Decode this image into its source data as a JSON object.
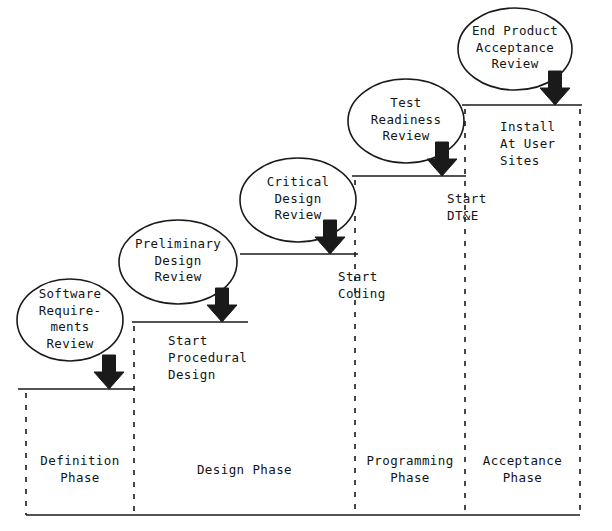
{
  "diagram": {
    "colors": {
      "line": "#1a1a1a",
      "arrow_fill": "#1a1a1a",
      "ellipse_stroke": "#1a1a1a",
      "background": "#ffffff",
      "text": "#141414"
    },
    "reviews": [
      {
        "id": "software-requirements-review",
        "lines": [
          "Software",
          "Require-",
          "ments",
          "Review"
        ],
        "cx": 70,
        "cy": 320,
        "rx": 53,
        "ry": 41
      },
      {
        "id": "preliminary-design-review",
        "lines": [
          "Preliminary",
          "Design",
          "Review"
        ],
        "cx": 178,
        "cy": 262,
        "rx": 59,
        "ry": 42
      },
      {
        "id": "critical-design-review",
        "lines": [
          "Critical",
          "Design",
          "Review"
        ],
        "cx": 298,
        "cy": 200,
        "rx": 58,
        "ry": 42
      },
      {
        "id": "test-readiness-review",
        "lines": [
          "Test",
          "Readiness",
          "Review"
        ],
        "cx": 406,
        "cy": 121,
        "rx": 58,
        "ry": 42
      },
      {
        "id": "end-product-acceptance-review",
        "lines": [
          "End Product",
          "Acceptance",
          "Review"
        ],
        "cx": 515,
        "cy": 49,
        "rx": 57,
        "ry": 41
      }
    ],
    "milestones": [
      {
        "id": "start-procedural-design",
        "lines": [
          "Start",
          "Procedural",
          "Design"
        ],
        "x": 168,
        "y": 332,
        "align": "left"
      },
      {
        "id": "start-coding",
        "lines": [
          "Start",
          "Coding"
        ],
        "x": 338,
        "y": 268,
        "align": "left"
      },
      {
        "id": "start-dtande",
        "lines": [
          "Start",
          "DT&E"
        ],
        "x": 447,
        "y": 190,
        "align": "left"
      },
      {
        "id": "install-at-user-sites",
        "lines": [
          "Install",
          "At User",
          "Sites"
        ],
        "x": 500,
        "y": 118,
        "align": "left"
      }
    ],
    "phases": [
      {
        "id": "definition-phase",
        "lines": [
          "Definition",
          "Phase"
        ],
        "x0": 26,
        "x1": 134,
        "label_y": 452
      },
      {
        "id": "design-phase",
        "lines": [
          "Design Phase"
        ],
        "x0": 134,
        "x1": 355,
        "label_y": 461
      },
      {
        "id": "programming-phase",
        "lines": [
          "Programming",
          "Phase"
        ],
        "x0": 355,
        "x1": 465,
        "label_y": 452
      },
      {
        "id": "acceptance-phase",
        "lines": [
          "Acceptance",
          "Phase"
        ],
        "x0": 465,
        "x1": 580,
        "label_y": 452
      }
    ],
    "steps": [
      {
        "id": "step-definition",
        "x0": 18,
        "x1": 134,
        "y": 389,
        "arrow_x": 109
      },
      {
        "id": "step-design-1",
        "x0": 132,
        "x1": 248,
        "y": 322,
        "arrow_x": 222
      },
      {
        "id": "step-design-2",
        "x0": 240,
        "x1": 358,
        "y": 254,
        "arrow_x": 330
      },
      {
        "id": "step-programming",
        "x0": 352,
        "x1": 466,
        "y": 176,
        "arrow_x": 442
      },
      {
        "id": "step-acceptance",
        "x0": 462,
        "x1": 582,
        "y": 105,
        "arrow_x": 555
      }
    ],
    "dividers": [
      {
        "id": "divider-1",
        "x": 26,
        "y0": 393,
        "y1": 515
      },
      {
        "id": "divider-2",
        "x": 134,
        "y0": 326,
        "y1": 515
      },
      {
        "id": "divider-3",
        "x": 355,
        "y0": 180,
        "y1": 515
      },
      {
        "id": "divider-4",
        "x": 465,
        "y0": 109,
        "y1": 515
      },
      {
        "id": "divider-5",
        "x": 580,
        "y0": 109,
        "y1": 515
      }
    ],
    "baselines": [
      {
        "id": "baseline-definition",
        "x0": 26,
        "x1": 134,
        "y": 515
      },
      {
        "id": "baseline-design",
        "x0": 134,
        "x1": 355,
        "y": 515
      },
      {
        "id": "baseline-programming",
        "x0": 355,
        "x1": 465,
        "y": 515
      },
      {
        "id": "baseline-acceptance",
        "x0": 465,
        "x1": 580,
        "y": 515
      }
    ]
  }
}
